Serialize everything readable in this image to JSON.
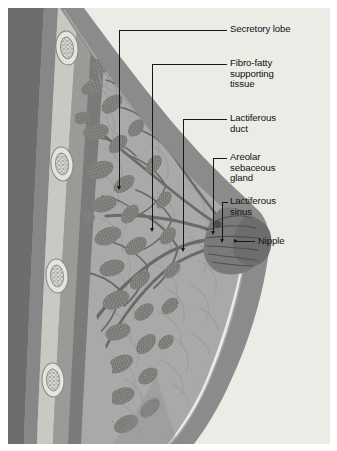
{
  "figure": {
    "background_color": "#a9a9a9",
    "plate_margin_color": "#ffffff",
    "ink_color": "#15181a",
    "text_color": "#111111"
  },
  "labels": [
    {
      "id": "secretory-lobe",
      "text": "Secretory lobe",
      "text_x": 230,
      "text_y": 24,
      "leader": {
        "from_x": 227,
        "from_y": 30,
        "to_x": 119,
        "to_y": 30,
        "drop_to_y": 189,
        "arrow": "down"
      }
    },
    {
      "id": "fibro-fatty-supporting-tissue",
      "text": "Fibro-fatty\nsupporting\ntissue",
      "text_x": 230,
      "text_y": 58,
      "leader": {
        "from_x": 227,
        "from_y": 64,
        "to_x": 152,
        "to_y": 64,
        "drop_to_y": 229,
        "arrow": "down"
      }
    },
    {
      "id": "lactiferous-duct",
      "text": "Lactiferous\nduct",
      "text_x": 230,
      "text_y": 113,
      "leader": {
        "from_x": 227,
        "from_y": 119,
        "to_x": 183,
        "to_y": 119,
        "drop_to_y": 249,
        "arrow": "down"
      }
    },
    {
      "id": "areolar-sebaceous-gland",
      "text": "Areolar\nsebaceous\ngland",
      "text_x": 230,
      "text_y": 152,
      "leader": {
        "from_x": 227,
        "from_y": 158,
        "to_x": 213,
        "to_y": 158,
        "drop_to_y": 232,
        "arrow": "down"
      }
    },
    {
      "id": "lactiferous-sinus",
      "text": "Lactiferous\nsinus",
      "text_x": 230,
      "text_y": 196,
      "leader": {
        "from_x": 227,
        "from_y": 202,
        "to_x": 222,
        "to_y": 202,
        "drop_to_y": 240,
        "arrow": "down"
      }
    },
    {
      "id": "nipple",
      "text": "Nipple",
      "text_x": 258,
      "text_y": 236,
      "leader": {
        "from_x": 255,
        "from_y": 241,
        "to_x": 237,
        "to_y": 241,
        "drop_to_y": 241,
        "arrow": "right"
      }
    }
  ],
  "anatomy": {
    "structures": [
      {
        "name": "Chest wall / thoracic cavity",
        "tone": "#6f6f6f"
      },
      {
        "name": "Intercostal muscle layer",
        "tone": "#8e8e8e"
      },
      {
        "name": "Rib cross-sections",
        "tone": "#d6d6d2",
        "count": 4
      },
      {
        "name": "Pectoral fascia",
        "tone": "#7c7c7c"
      },
      {
        "name": "Breast parenchyma (fat)",
        "tone": "#e9e9e4"
      },
      {
        "name": "Secretory lobules",
        "tone": "#6b6b68"
      },
      {
        "name": "Duct tree",
        "tone": "#6b6b68"
      },
      {
        "name": "Skin / subcutaneous envelope",
        "tone": "#8a8a8a"
      },
      {
        "name": "Nipple and areola",
        "tone": "#6e6e6e"
      }
    ]
  }
}
